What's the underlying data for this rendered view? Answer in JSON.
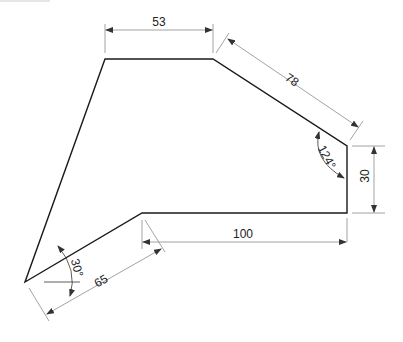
{
  "drawing": {
    "type": "2D technical drawing with dimensions",
    "colors": {
      "outline": "#1a1a1a",
      "dimension": "#8a8a8a",
      "text": "#222222"
    },
    "shape_vertices": [
      [
        105,
        59
      ],
      [
        213,
        59
      ],
      [
        347,
        146
      ],
      [
        347,
        213
      ],
      [
        142,
        213
      ],
      [
        25,
        282
      ]
    ],
    "dimensions": {
      "top_edge": "53",
      "slanted_edge": "78",
      "angle_upper_right": "124°",
      "right_edge": "30",
      "bottom_edge": "100",
      "lower_left_edge": "65",
      "angle_lower_left": "30°"
    }
  }
}
